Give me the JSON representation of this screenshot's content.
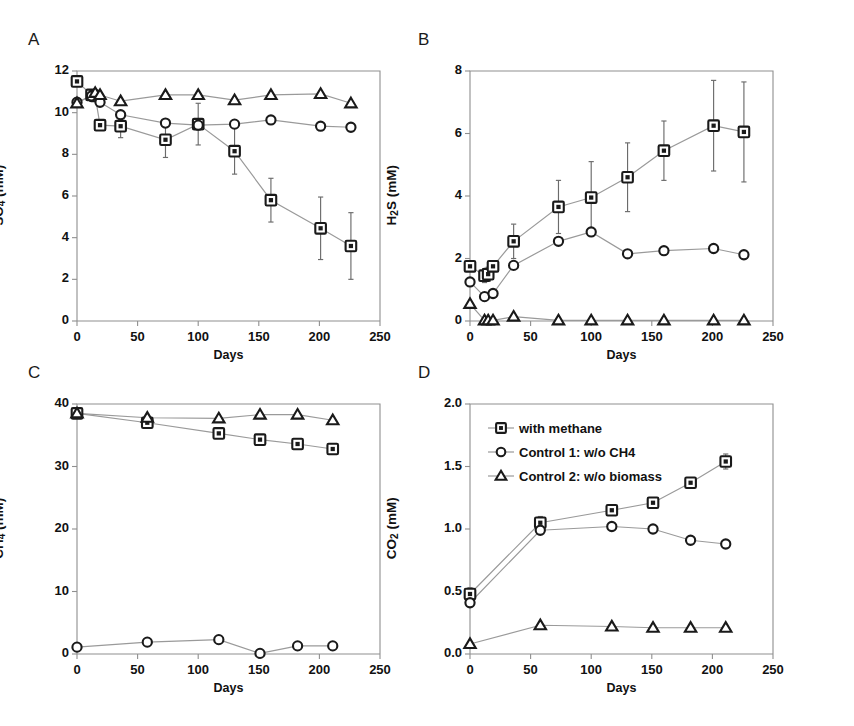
{
  "figure": {
    "width": 854,
    "height": 726,
    "background": "#ffffff",
    "line_color": "#9a9a9a",
    "marker_color": "#1a1a1a"
  },
  "legend": {
    "position": "panel-D-top-left",
    "items": [
      {
        "marker": "square",
        "label": "with methane"
      },
      {
        "marker": "circle",
        "label": "Control 1: w/o CH4"
      },
      {
        "marker": "triangle",
        "label": "Control 2: w/o biomass"
      }
    ]
  },
  "panels": [
    {
      "letter": "A",
      "ylabel_html": "SO<sub>4</sub> (mM)",
      "xlabel": "Days",
      "ylim": [
        0,
        12
      ],
      "yticks": [
        "0",
        "2",
        "4",
        "6",
        "8",
        "10",
        "12"
      ],
      "ytick_values": [
        0,
        2,
        4,
        6,
        8,
        10,
        12
      ],
      "xlim": [
        0,
        250
      ],
      "xticks": [
        "0",
        "50",
        "100",
        "150",
        "200",
        "250"
      ],
      "xtick_values": [
        0,
        50,
        100,
        150,
        200,
        250
      ]
    },
    {
      "letter": "B",
      "ylabel_html": "H<sub>2</sub>S (mM)",
      "xlabel": "Days",
      "ylim": [
        0,
        8
      ],
      "yticks": [
        "0",
        "2",
        "4",
        "6",
        "8"
      ],
      "ytick_values": [
        0,
        2,
        4,
        6,
        8
      ],
      "xlim": [
        0,
        250
      ],
      "xticks": [
        "0",
        "50",
        "100",
        "150",
        "200",
        "250"
      ],
      "xtick_values": [
        0,
        50,
        100,
        150,
        200,
        250
      ]
    },
    {
      "letter": "C",
      "ylabel_html": "CH<sub>4</sub> (mM)",
      "xlabel": "Days",
      "ylim": [
        0,
        40
      ],
      "yticks": [
        "0",
        "10",
        "20",
        "30",
        "40"
      ],
      "ytick_values": [
        0,
        10,
        20,
        30,
        40
      ],
      "xlim": [
        0,
        250
      ],
      "xticks": [
        "0",
        "50",
        "100",
        "150",
        "200",
        "250"
      ],
      "xtick_values": [
        0,
        50,
        100,
        150,
        200,
        250
      ]
    },
    {
      "letter": "D",
      "ylabel_html": "CO<sub>2</sub> (mM)",
      "xlabel": "Days",
      "ylim": [
        0,
        2.0
      ],
      "yticks": [
        "0.0",
        "0.5",
        "1.0",
        "1.5",
        "2.0"
      ],
      "ytick_values": [
        0,
        0.5,
        1.0,
        1.5,
        2.0
      ],
      "xlim": [
        0,
        250
      ],
      "xticks": [
        "0",
        "50",
        "100",
        "150",
        "200",
        "250"
      ],
      "xtick_values": [
        0,
        50,
        100,
        150,
        200,
        250
      ]
    }
  ],
  "chart_data": [
    {
      "panel": "A",
      "type": "line",
      "title": "A",
      "xlabel": "Days",
      "ylabel": "SO4 (mM)",
      "xlim": [
        0,
        250
      ],
      "ylim": [
        0,
        12
      ],
      "grid": false,
      "legend_position": "panel D",
      "series": [
        {
          "name": "with methane",
          "marker": "square",
          "x": [
            0,
            12,
            15,
            19,
            36,
            73,
            100,
            130,
            160,
            201,
            226
          ],
          "y": [
            11.5,
            10.85,
            10.8,
            9.4,
            9.35,
            8.7,
            9.45,
            8.15,
            5.8,
            4.45,
            3.6
          ],
          "yerr": [
            0,
            0.15,
            0.15,
            0,
            0.55,
            0.85,
            1.0,
            1.1,
            1.05,
            1.5,
            1.6
          ]
        },
        {
          "name": "Control 1: w/o CH4",
          "marker": "circle",
          "x": [
            0,
            12,
            19,
            36,
            73,
            100,
            130,
            160,
            201,
            226
          ],
          "y": [
            10.5,
            10.8,
            10.5,
            9.9,
            9.5,
            9.4,
            9.45,
            9.65,
            9.35,
            9.3
          ],
          "yerr": [
            0,
            0,
            0,
            0,
            0,
            0,
            0,
            0,
            0,
            0
          ]
        },
        {
          "name": "Control 2: w/o biomass",
          "marker": "triangle",
          "x": [
            0,
            15,
            19,
            36,
            73,
            100,
            130,
            160,
            201,
            226
          ],
          "y": [
            10.45,
            10.95,
            10.85,
            10.55,
            10.85,
            10.85,
            10.6,
            10.85,
            10.9,
            10.45
          ],
          "yerr": [
            0,
            0,
            0,
            0,
            0,
            0,
            0,
            0,
            0,
            0
          ]
        }
      ]
    },
    {
      "panel": "B",
      "type": "line",
      "title": "B",
      "xlabel": "Days",
      "ylabel": "H2S (mM)",
      "xlim": [
        0,
        250
      ],
      "ylim": [
        0,
        8
      ],
      "grid": false,
      "series": [
        {
          "name": "with methane",
          "marker": "square",
          "x": [
            0,
            12,
            15,
            19,
            36,
            73,
            100,
            130,
            160,
            201,
            226
          ],
          "y": [
            1.75,
            1.45,
            1.5,
            1.75,
            2.55,
            3.65,
            3.95,
            4.6,
            5.45,
            6.25,
            6.05
          ],
          "yerr": [
            0.12,
            0.22,
            0.22,
            0.15,
            0.55,
            0.85,
            1.15,
            1.1,
            0.95,
            1.45,
            1.6
          ]
        },
        {
          "name": "Control 1: w/o CH4",
          "marker": "circle",
          "x": [
            0,
            12,
            19,
            36,
            73,
            100,
            130,
            160,
            201,
            226
          ],
          "y": [
            1.25,
            0.78,
            0.88,
            1.78,
            2.55,
            2.85,
            2.15,
            2.25,
            2.32,
            2.12
          ],
          "yerr": [
            0,
            0,
            0,
            0,
            0,
            0,
            0,
            0,
            0,
            0
          ]
        },
        {
          "name": "Control 2: w/o biomass",
          "marker": "triangle",
          "x": [
            0,
            12,
            15,
            19,
            36,
            73,
            100,
            130,
            160,
            201,
            226
          ],
          "y": [
            0.55,
            0.02,
            0.02,
            0.02,
            0.14,
            0.02,
            0.02,
            0.02,
            0.02,
            0.02,
            0.02
          ],
          "yerr": [
            0,
            0,
            0,
            0,
            0,
            0,
            0,
            0,
            0,
            0,
            0
          ]
        }
      ]
    },
    {
      "panel": "C",
      "type": "line",
      "title": "C",
      "xlabel": "Days",
      "ylabel": "CH4 (mM)",
      "xlim": [
        0,
        250
      ],
      "ylim": [
        0,
        40
      ],
      "grid": false,
      "series": [
        {
          "name": "with methane",
          "marker": "square",
          "x": [
            0,
            58,
            117,
            151,
            182,
            211
          ],
          "y": [
            38.5,
            37.0,
            35.3,
            34.3,
            33.6,
            32.8
          ],
          "yerr": [
            0.3,
            0.5,
            0.3,
            0.3,
            0.3,
            0.4
          ]
        },
        {
          "name": "Control 1: w/o CH4",
          "marker": "circle",
          "x": [
            0,
            58,
            117,
            151,
            182,
            211
          ],
          "y": [
            1.1,
            1.9,
            2.3,
            0.1,
            1.3,
            1.3
          ],
          "yerr": [
            0,
            0,
            0,
            0,
            0,
            0
          ]
        },
        {
          "name": "Control 2: w/o biomass",
          "marker": "triangle",
          "x": [
            0,
            58,
            117,
            151,
            182,
            211
          ],
          "y": [
            38.5,
            37.8,
            37.7,
            38.3,
            38.3,
            37.4
          ],
          "yerr": [
            0,
            0,
            0,
            0,
            0,
            0
          ]
        }
      ]
    },
    {
      "panel": "D",
      "type": "line",
      "title": "D",
      "xlabel": "Days",
      "ylabel": "CO2 (mM)",
      "xlim": [
        0,
        250
      ],
      "ylim": [
        0,
        2.0
      ],
      "grid": false,
      "series": [
        {
          "name": "with methane",
          "marker": "square",
          "x": [
            0,
            58,
            117,
            151,
            182,
            211
          ],
          "y": [
            0.48,
            1.05,
            1.15,
            1.21,
            1.37,
            1.54
          ],
          "yerr": [
            0.05,
            0.05,
            0.04,
            0.04,
            0.04,
            0.06
          ]
        },
        {
          "name": "Control 1: w/o CH4",
          "marker": "circle",
          "x": [
            0,
            58,
            117,
            151,
            182,
            211
          ],
          "y": [
            0.41,
            0.99,
            1.02,
            1.0,
            0.91,
            0.88
          ],
          "yerr": [
            0,
            0,
            0,
            0,
            0,
            0
          ]
        },
        {
          "name": "Control 2: w/o biomass",
          "marker": "triangle",
          "x": [
            0,
            58,
            117,
            151,
            182,
            211
          ],
          "y": [
            0.08,
            0.23,
            0.22,
            0.21,
            0.21,
            0.21
          ],
          "yerr": [
            0,
            0,
            0,
            0,
            0,
            0
          ]
        }
      ]
    }
  ]
}
